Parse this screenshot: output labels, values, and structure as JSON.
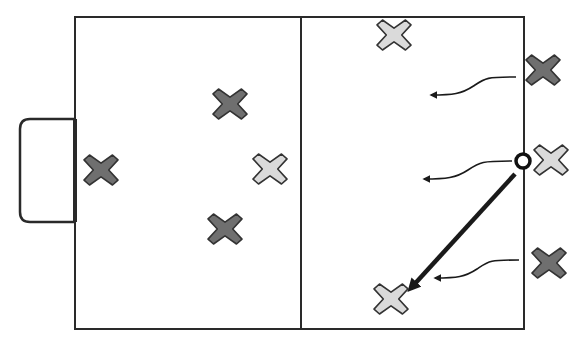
{
  "diagram": {
    "type": "court-play-diagram",
    "colors": {
      "background": "#ffffff",
      "line": "#2a2a2a",
      "team_dark_fill": "#6f6f6f",
      "team_dark_stroke": "#333333",
      "team_light_fill": "#dadada",
      "team_light_stroke": "#333333",
      "ball_stroke": "#111111",
      "pass_line": "#1a1a1a"
    },
    "court": {
      "x": 75,
      "y": 17,
      "width": 449,
      "height": 312,
      "midline_x": 301
    },
    "goal": {
      "x": 20,
      "y": 119,
      "width": 55,
      "height": 103,
      "radius": 10
    },
    "players": [
      {
        "team": "dark",
        "x": 101,
        "y": 170
      },
      {
        "team": "dark",
        "x": 230,
        "y": 104
      },
      {
        "team": "dark",
        "x": 225,
        "y": 229
      },
      {
        "team": "dark",
        "x": 543,
        "y": 70
      },
      {
        "team": "dark",
        "x": 549,
        "y": 263
      },
      {
        "team": "light",
        "x": 394,
        "y": 35
      },
      {
        "team": "light",
        "x": 270,
        "y": 169
      },
      {
        "team": "light",
        "x": 551,
        "y": 160
      },
      {
        "team": "light",
        "x": 391,
        "y": 299
      }
    ],
    "ball": {
      "x": 523,
      "y": 161,
      "r": 7
    },
    "pass": {
      "x1": 515,
      "y1": 174,
      "x2": 411,
      "y2": 288
    },
    "runs": [
      {
        "x1": 516,
        "y1": 77,
        "x2": 431,
        "y2": 95
      },
      {
        "x1": 512,
        "y1": 161,
        "x2": 424,
        "y2": 179
      },
      {
        "x1": 519,
        "y1": 260,
        "x2": 435,
        "y2": 278
      }
    ]
  }
}
